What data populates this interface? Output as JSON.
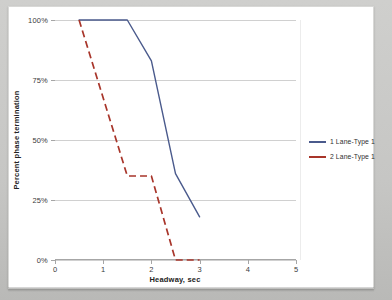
{
  "chart_data": {
    "type": "line",
    "title": "",
    "xlabel": "Headway, sec",
    "ylabel": "Percent phase termination",
    "xlim": [
      0,
      5
    ],
    "ylim": [
      0,
      100
    ],
    "xticks": [
      0,
      1,
      2,
      3,
      4,
      5
    ],
    "xtick_labels": [
      "0",
      "1",
      "2",
      "3",
      "4",
      "5"
    ],
    "yticks": [
      0,
      25,
      50,
      75,
      100
    ],
    "ytick_labels": [
      "0%",
      "25%",
      "50%",
      "75%",
      "100%"
    ],
    "grid": "horizontal",
    "legend_position": "right",
    "series": [
      {
        "name": "1 Lane-Type 1",
        "color": "#4a5a8c",
        "style": "solid",
        "x": [
          0.5,
          1.5,
          2.0,
          2.5,
          3.0
        ],
        "values": [
          100,
          100,
          83,
          36,
          18
        ]
      },
      {
        "name": "2 Lane-Type 1",
        "color": "#a8352a",
        "style": "dashed",
        "x": [
          0.5,
          1.5,
          2.0,
          2.5,
          3.0
        ],
        "values": [
          100,
          35,
          35,
          0,
          0
        ]
      }
    ]
  },
  "legend": {
    "items": [
      {
        "label": "1 Lane-Type 1",
        "color": "#4a5a8c"
      },
      {
        "label": "2 Lane-Type 1",
        "color": "#a8352a"
      }
    ]
  }
}
